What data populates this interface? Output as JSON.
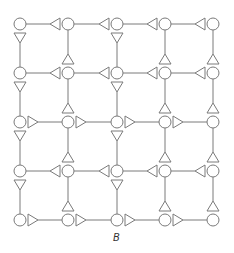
{
  "figure": {
    "caption": "B",
    "grid": {
      "rows": 5,
      "cols": 5,
      "col_x": [
        20,
        68,
        117,
        165,
        213
      ],
      "row_y": [
        24,
        73,
        122,
        171,
        220
      ],
      "node_radius": 6,
      "node_shape": "circle",
      "stroke_color": "#7a7a7a"
    },
    "horizontal_edges": [
      {
        "row": 0,
        "direction": "left"
      },
      {
        "row": 1,
        "direction": "left"
      },
      {
        "row": 2,
        "direction": "right"
      },
      {
        "row": 3,
        "direction": "left"
      },
      {
        "row": 4,
        "direction": "right"
      }
    ],
    "vertical_edges_by_column": [
      {
        "col": 0,
        "arrow_at": "top",
        "arrow_glyph": "triangle-down"
      },
      {
        "col": 1,
        "arrow_at": "bottom",
        "arrow_glyph": "triangle-up"
      },
      {
        "col": 2,
        "arrow_at": "top",
        "arrow_glyph": "triangle-down"
      },
      {
        "col": 3,
        "arrow_at": "bottom",
        "arrow_glyph": "triangle-up"
      },
      {
        "col": 4,
        "arrow_at": "bottom",
        "arrow_glyph": "triangle-up"
      }
    ],
    "legend_notes": {
      "left": "horizontal edge with left-pointing triangle next to right node",
      "right": "horizontal edge with right-pointing triangle next to left node"
    }
  }
}
